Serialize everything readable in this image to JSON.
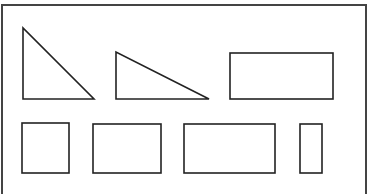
{
  "figure": {
    "stroke_color": "#222222",
    "frame_color": "#444444",
    "background": "#ffffff",
    "frame": {
      "x": 2,
      "y": 5,
      "width": 364,
      "height": 190
    },
    "shapes": [
      {
        "type": "right-triangle",
        "points": "23,28 23,99 94,99"
      },
      {
        "type": "right-triangle",
        "points": "116,52 116,99 209,99"
      },
      {
        "type": "rectangle",
        "x": 230,
        "y": 53,
        "width": 103,
        "height": 46
      },
      {
        "type": "square",
        "x": 22,
        "y": 123,
        "width": 47,
        "height": 50
      },
      {
        "type": "rectangle",
        "x": 93,
        "y": 124,
        "width": 68,
        "height": 49
      },
      {
        "type": "rectangle",
        "x": 184,
        "y": 124,
        "width": 91,
        "height": 49
      },
      {
        "type": "rectangle",
        "x": 300,
        "y": 124,
        "width": 22,
        "height": 49
      }
    ]
  }
}
